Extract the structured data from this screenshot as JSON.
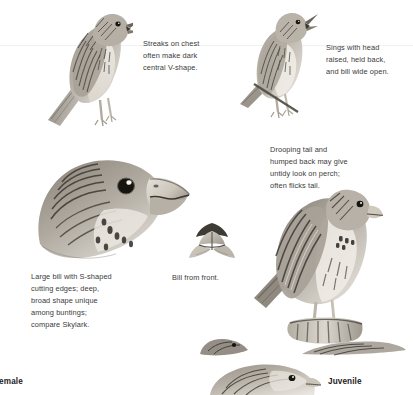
{
  "page": {
    "width": 413,
    "height": 395,
    "background": "#ffffff",
    "text_color": "#3a3a3a",
    "label_color": "#1c1c1c",
    "plate_subject": "bunting field guide plate"
  },
  "annotations": [
    {
      "id": "streaks-on-chest",
      "text": "Streaks on chest\noften make dark\ncentral V-shape.",
      "x": 143,
      "y": 38
    },
    {
      "id": "sings-with-head",
      "text": "Sings with head\nraised, held back,\nand bill wide open.",
      "x": 326,
      "y": 42
    },
    {
      "id": "drooping-tail",
      "text": "Drooping tail and\nhumped back may give\nuntidy look on perch;\noften flicks tail.",
      "x": 270,
      "y": 144
    },
    {
      "id": "large-bill",
      "text": "Large bill with S-shaped\ncutting edges; deep,\nbroad shape unique\namong buntings;\ncompare Skylark.",
      "x": 31,
      "y": 271
    },
    {
      "id": "bill-from-front",
      "text": "Bill from front.",
      "x": 172,
      "y": 272
    }
  ],
  "specimen_labels": [
    {
      "id": "female",
      "text": "Female",
      "x": -6,
      "y": 377,
      "clipped": "left"
    },
    {
      "id": "juvenile",
      "text": "Juvenile",
      "x": 328,
      "y": 377,
      "clipped": "none"
    }
  ],
  "figures": [
    {
      "id": "singing-bunting-left",
      "caption_ref": "streaks-on-chest",
      "x": 38,
      "y": 2,
      "width": 95,
      "height": 128,
      "pose": "perched, singing, bill open, side view facing right"
    },
    {
      "id": "singing-bunting-right",
      "caption_ref": "sings-with-head",
      "x": 228,
      "y": 8,
      "width": 92,
      "height": 112,
      "pose": "perched, head raised and held back, bill wide open"
    },
    {
      "id": "head-profile-detail",
      "caption_ref": "large-bill",
      "x": 32,
      "y": 152,
      "width": 165,
      "height": 112,
      "pose": "enlarged head profile showing deep S-shaped bill"
    },
    {
      "id": "bill-front-detail",
      "caption_ref": "bill-from-front",
      "x": 186,
      "y": 221,
      "width": 52,
      "height": 44,
      "pose": "bill viewed head-on from the front"
    },
    {
      "id": "perched-bunting-large",
      "caption_ref": "drooping-tail",
      "x": 252,
      "y": 186,
      "width": 132,
      "height": 160,
      "pose": "perched on post, drooping tail, humped back"
    },
    {
      "id": "female-partial-top",
      "caption_ref": "female",
      "x": 192,
      "y": 336,
      "width": 60,
      "height": 22,
      "pose": "head and bill tip cropped by page edge"
    },
    {
      "id": "juvenile-partial",
      "caption_ref": "juvenile",
      "x": 212,
      "y": 360,
      "width": 115,
      "height": 35,
      "pose": "head and upper body cropped by bottom page edge"
    },
    {
      "id": "wing-partial-top-right",
      "caption_ref": null,
      "x": 300,
      "y": 340,
      "width": 105,
      "height": 16,
      "pose": "wing and tail fragment cropped by page edge"
    }
  ],
  "rules": [
    {
      "id": "faint-hairline",
      "y": 45,
      "color": "#f1f1f1"
    }
  ]
}
